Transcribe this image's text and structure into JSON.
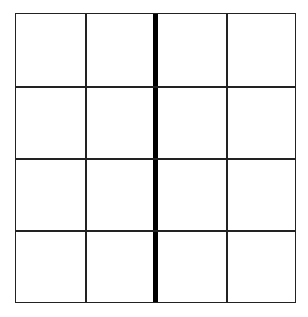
{
  "grid": {
    "rows": 4,
    "columns": 4,
    "cells": [
      [
        "",
        "",
        "",
        ""
      ],
      [
        "",
        "",
        "",
        ""
      ],
      [
        "",
        "",
        "",
        ""
      ],
      [
        "",
        "",
        "",
        ""
      ]
    ],
    "divider": "thick vertical line between columns 2 and 3",
    "line_color": "#222222",
    "divider_color": "#000000"
  }
}
